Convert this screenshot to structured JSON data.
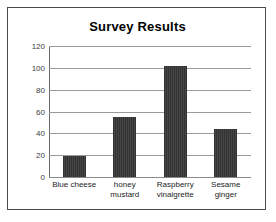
{
  "chart_data": {
    "type": "bar",
    "title": "Survey Results",
    "xlabel": "",
    "ylabel": "",
    "categories": [
      "Blue cheese",
      "honey mustard",
      "Raspberry vinaigrette",
      "Sesame ginger"
    ],
    "category_lines": [
      [
        "Blue cheese"
      ],
      [
        "honey",
        "mustard"
      ],
      [
        "Raspberry",
        "vinaigrette"
      ],
      [
        "Sesame",
        "ginger"
      ]
    ],
    "values": [
      19,
      55,
      102,
      44
    ],
    "ylim": [
      0,
      120
    ],
    "yticks": [
      0,
      20,
      40,
      60,
      80,
      100,
      120
    ],
    "ytick_labels": [
      "0",
      "20",
      "40",
      "60",
      "80",
      "100",
      "120"
    ],
    "grid": true,
    "legend": false,
    "bar_color": "#3a3a3a",
    "gridline_color": "#9a9a9a",
    "border_color": "#4a4a4a",
    "background_color": "#ffffff"
  }
}
